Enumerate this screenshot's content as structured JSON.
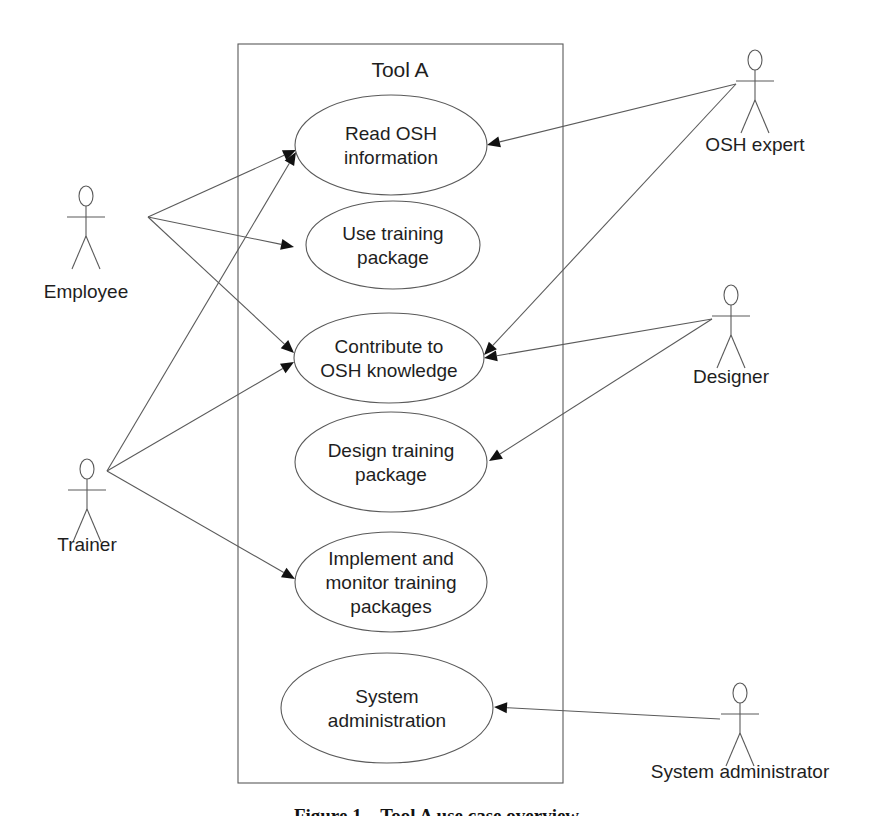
{
  "system": {
    "title": "Tool A"
  },
  "use_cases": [
    {
      "id": "read",
      "lines": [
        "Read OSH",
        "information"
      ]
    },
    {
      "id": "use",
      "lines": [
        "Use training",
        "package"
      ]
    },
    {
      "id": "contribute",
      "lines": [
        "Contribute to",
        "OSH knowledge"
      ]
    },
    {
      "id": "design",
      "lines": [
        "Design training",
        "package"
      ]
    },
    {
      "id": "implement",
      "lines": [
        "Implement and",
        "monitor training",
        "packages"
      ]
    },
    {
      "id": "sysadmin",
      "lines": [
        "System",
        "administration"
      ]
    }
  ],
  "actors": [
    {
      "id": "employee",
      "label": "Employee"
    },
    {
      "id": "trainer",
      "label": "Trainer"
    },
    {
      "id": "osh-expert",
      "label": "OSH expert"
    },
    {
      "id": "designer",
      "label": "Designer"
    },
    {
      "id": "system-administrator",
      "label": "System administrator"
    }
  ],
  "associations": [
    {
      "from": "employee",
      "to": "read"
    },
    {
      "from": "employee",
      "to": "use"
    },
    {
      "from": "employee",
      "to": "contribute"
    },
    {
      "from": "trainer",
      "to": "read"
    },
    {
      "from": "trainer",
      "to": "contribute"
    },
    {
      "from": "trainer",
      "to": "implement"
    },
    {
      "from": "osh-expert",
      "to": "read"
    },
    {
      "from": "osh-expert",
      "to": "contribute"
    },
    {
      "from": "designer",
      "to": "contribute"
    },
    {
      "from": "designer",
      "to": "design"
    },
    {
      "from": "system-administrator",
      "to": "sysadmin"
    }
  ],
  "caption": "Figure 1 – Tool A use case overview"
}
